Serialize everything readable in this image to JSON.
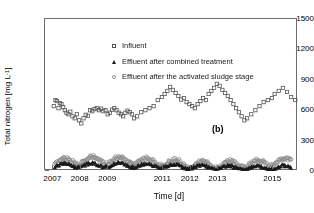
{
  "chart_data": {
    "type": "scatter",
    "title": "",
    "panel_label": "(b)",
    "xlabel": "Time [d]",
    "ylabel_text": "Total nitrogen [mg L",
    "ylabel_sup": "-1",
    "ylabel_tail": "]",
    "ylim": [
      0,
      1500
    ],
    "yticks": [
      0,
      300,
      600,
      900,
      1200,
      1500
    ],
    "ytick_labels": [
      "0",
      "300",
      "600",
      "900",
      "1200",
      "1500"
    ],
    "xlim": [
      2006.7,
      2015.9
    ],
    "xticks": [
      2007,
      2008,
      2009,
      2011,
      2012,
      2013,
      2015
    ],
    "xtick_labels": [
      "2007",
      "2008",
      "2009",
      "2011",
      "2012",
      "2013",
      "2015"
    ],
    "grid": false,
    "legend_position": "top-left-inside",
    "colors": {
      "influent": "#555555",
      "effluent_combined": "#1a1a1a",
      "effluent_activated_sludge": "#8a8a8a",
      "frame": "#6d6d6d"
    },
    "series": [
      {
        "name": "Influent",
        "marker": "open-square",
        "x": [
          2007.02,
          2007.08,
          2007.13,
          2007.19,
          2007.24,
          2007.3,
          2007.36,
          2007.42,
          2007.48,
          2007.55,
          2007.62,
          2007.7,
          2007.78,
          2007.86,
          2007.94,
          2008.02,
          2008.1,
          2008.18,
          2008.26,
          2008.34,
          2008.42,
          2008.5,
          2008.58,
          2008.66,
          2008.74,
          2008.82,
          2008.9,
          2008.98,
          2009.06,
          2009.14,
          2009.22,
          2009.3,
          2009.38,
          2009.46,
          2009.54,
          2009.62,
          2009.7,
          2009.78,
          2009.86,
          2009.94,
          2010.05,
          2010.2,
          2010.35,
          2010.5,
          2010.65,
          2010.8,
          2010.95,
          2011.05,
          2011.15,
          2011.25,
          2011.35,
          2011.45,
          2011.55,
          2011.65,
          2011.75,
          2011.85,
          2011.95,
          2012.05,
          2012.15,
          2012.25,
          2012.35,
          2012.45,
          2012.55,
          2012.65,
          2012.75,
          2012.85,
          2012.95,
          2013.05,
          2013.15,
          2013.25,
          2013.35,
          2013.45,
          2013.55,
          2013.65,
          2013.75,
          2013.85,
          2013.95,
          2014.05,
          2014.2,
          2014.35,
          2014.5,
          2014.65,
          2014.8,
          2014.95,
          2015.05,
          2015.2,
          2015.35,
          2015.5,
          2015.65,
          2015.8
        ],
        "y": [
          640,
          700,
          690,
          620,
          670,
          660,
          630,
          600,
          575,
          560,
          585,
          540,
          520,
          560,
          500,
          470,
          520,
          555,
          545,
          600,
          590,
          610,
          620,
          600,
          615,
          590,
          600,
          560,
          575,
          605,
          620,
          600,
          575,
          560,
          540,
          575,
          595,
          580,
          560,
          520,
          540,
          580,
          600,
          620,
          640,
          700,
          730,
          760,
          790,
          830,
          800,
          770,
          740,
          705,
          720,
          680,
          660,
          640,
          620,
          660,
          690,
          720,
          700,
          760,
          790,
          820,
          860,
          840,
          800,
          770,
          740,
          700,
          660,
          620,
          580,
          540,
          500,
          520,
          560,
          600,
          640,
          680,
          700,
          720,
          760,
          790,
          820,
          780,
          730,
          700
        ],
        "y_range_note": "most values 470-870 mg/L"
      },
      {
        "name": "Effluent after combined treatment",
        "marker": "filled-triangle",
        "y_mean": 45,
        "y_range": [
          10,
          135
        ],
        "description": "dense near-continuous low series along baseline"
      },
      {
        "name": "Effluent after the activated sludge stage",
        "marker": "open-circle",
        "y_mean": 85,
        "y_range": [
          25,
          185
        ],
        "description": "dense near-continuous low series slightly above the combined-treatment series"
      }
    ]
  },
  "legend": {
    "items": [
      {
        "label": "Influent",
        "marker": "open-square-icon"
      },
      {
        "label": "Effluent after combined treatment",
        "marker": "filled-triangle-icon"
      },
      {
        "label": "Effluent after the activated sludge stage",
        "marker": "open-circle-icon"
      }
    ]
  }
}
